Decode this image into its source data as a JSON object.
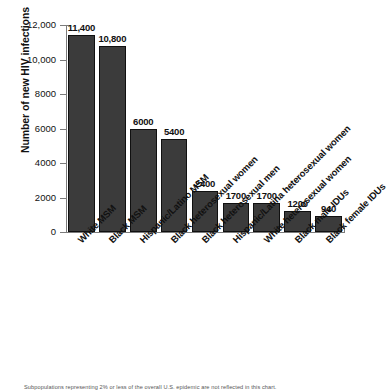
{
  "chart_data": {
    "type": "bar",
    "title": "",
    "xlabel": "",
    "ylabel": "Number of new HIV infections",
    "ylim": [
      0,
      12000
    ],
    "grid": false,
    "legend": null,
    "bar_color": "#3b3b3b",
    "categories": [
      "White MSM",
      "Black MSM",
      "Hispanic/Latino MSM",
      "Black heterosexual women",
      "Black heterosexual men",
      "Hispanic/Latina heterosexual women",
      "White heterosexual women",
      "Black male IDUs",
      "Black female IDUs"
    ],
    "values": [
      11400,
      10800,
      6000,
      5400,
      2400,
      1700,
      1700,
      1200,
      940
    ],
    "value_labels": [
      "11,400",
      "10,800",
      "6000",
      "5400",
      "2400",
      "1700",
      "1700",
      "1200",
      "940"
    ],
    "ytick_values": [
      0,
      2000,
      4000,
      6000,
      8000,
      10000,
      12000
    ],
    "ytick_labels": [
      "0",
      "2000",
      "4000",
      "6000",
      "8000",
      "10,000",
      "12,000"
    ],
    "annotation": "Subpopulations representing 2% or less of the overall U.S. epidemic are not reflected in this chart."
  }
}
